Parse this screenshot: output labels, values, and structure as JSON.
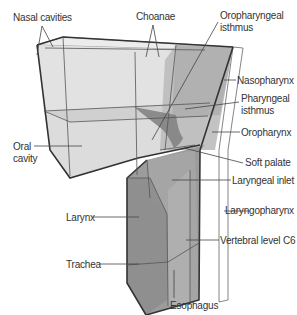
{
  "diagram": {
    "colors": {
      "light_fill": "#e4e4e4",
      "mid_fill": "#cfcfcf",
      "dark_fill": "#a9a9a9",
      "darker_fill": "#8f8f8f",
      "soft_palate": "#7d7d7d",
      "edge": "#555555",
      "label": "#333333"
    },
    "labels": {
      "nasal_cavities": "Nasal cavities",
      "choanae": "Choanae",
      "oropharyngeal_isthmus_1": "Oropharyngeal",
      "oropharyngeal_isthmus_2": "isthmus",
      "nasopharynx": "Nasopharynx",
      "pharyngeal_isthmus_1": "Pharyngeal",
      "pharyngeal_isthmus_2": "isthmus",
      "oral_cavity_1": "Oral",
      "oral_cavity_2": "cavity",
      "oropharynx": "Oropharynx",
      "soft_palate": "Soft palate",
      "laryngeal_inlet": "Laryngeal inlet",
      "larynx": "Larynx",
      "laryngopharynx": "Laryngopharynx",
      "vertebral_level": "Vertebral level C6",
      "trachea": "Trachea",
      "esophagus": "Esophagus"
    }
  }
}
